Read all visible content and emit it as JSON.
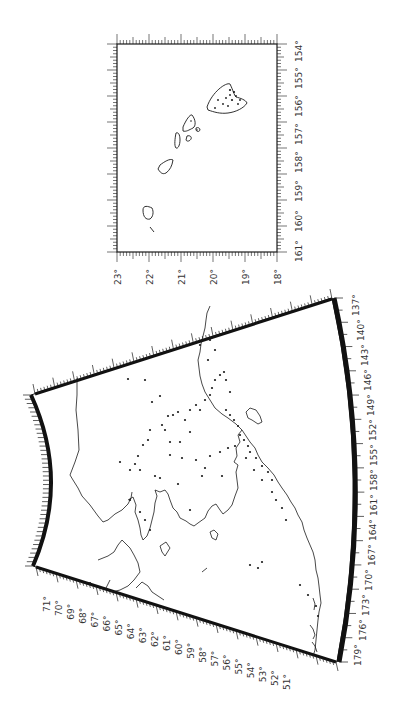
{
  "colors": {
    "ink": "#1a1a1a",
    "label": "#444444",
    "background": "#ffffff"
  },
  "hawaii_map": {
    "lat_labels": [
      "23°",
      "22°",
      "21°",
      "20°",
      "19°",
      "18°"
    ],
    "lon_labels": [
      "161°",
      "160°",
      "159°",
      "158°",
      "157°",
      "156°",
      "155°",
      "154°"
    ]
  },
  "alaska_map": {
    "lat_labels": [
      "71°",
      "70°",
      "69°",
      "68°",
      "67°",
      "66°",
      "65°",
      "64°",
      "63°",
      "62°",
      "61°",
      "60°",
      "59°",
      "58°",
      "57°",
      "56°",
      "55°",
      "54°",
      "53°",
      "52°",
      "51°"
    ],
    "lon_labels": [
      "179°",
      "176°",
      "173°",
      "170°",
      "167°",
      "164°",
      "161°",
      "158°",
      "155°",
      "152°",
      "149°",
      "146°",
      "143°",
      "140°",
      "137°"
    ]
  }
}
